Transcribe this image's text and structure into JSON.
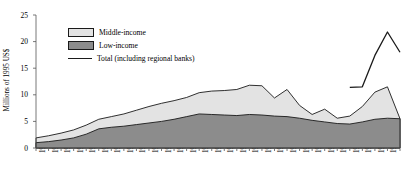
{
  "chart_data": {
    "type": "area",
    "stacked": true,
    "title": "",
    "subtitle": "",
    "xlabel": "",
    "ylabel": "Millions of 1995 US$",
    "ylim": [
      0,
      25
    ],
    "yticks": [
      0,
      5,
      10,
      15,
      20,
      25
    ],
    "ytick_labels": [
      "0",
      "5",
      "10",
      "15",
      "20",
      "25"
    ],
    "grid": false,
    "legend_position": "top-left",
    "categories": [
      "1970",
      "1971",
      "1972",
      "1973",
      "1974",
      "1975",
      "1976",
      "1977",
      "1978",
      "1979",
      "1980",
      "1981",
      "1982",
      "1983",
      "1984",
      "1985",
      "1986",
      "1987",
      "1988",
      "1989",
      "1990",
      "1991",
      "1992",
      "1993",
      "1994",
      "1995",
      "1996",
      "1997",
      "1998",
      "1999"
    ],
    "series": [
      {
        "name": "Low-income",
        "color": "#8c8c8c",
        "values": [
          1.0,
          1.2,
          1.5,
          1.9,
          2.6,
          3.6,
          3.9,
          4.1,
          4.4,
          4.7,
          5.0,
          5.4,
          5.9,
          6.4,
          6.3,
          6.2,
          6.1,
          6.3,
          6.2,
          6.0,
          5.9,
          5.6,
          5.2,
          4.9,
          4.6,
          4.5,
          4.9,
          5.4,
          5.6,
          5.5
        ]
      },
      {
        "name": "Middle-income",
        "color": "#e3e3e3",
        "values": [
          0.9,
          1.1,
          1.3,
          1.5,
          1.7,
          1.8,
          2.0,
          2.3,
          2.7,
          3.1,
          3.4,
          3.5,
          3.6,
          4.0,
          4.4,
          4.6,
          4.9,
          5.5,
          5.5,
          3.4,
          5.1,
          2.4,
          1.1,
          2.4,
          1.0,
          1.5,
          2.9,
          5.1,
          5.9,
          0.0
        ]
      }
    ],
    "total_line": {
      "name": "Total (including regional banks)",
      "color": "#1a1a1a",
      "x": [
        "1995",
        "1996",
        "1997",
        "1998",
        "1999"
      ],
      "values": [
        11.4,
        11.5,
        17.4,
        21.8,
        18.0
      ]
    },
    "legend": [
      {
        "label": "Middle-income",
        "marker": "filled-box",
        "color": "#e3e3e3"
      },
      {
        "label": "Low-income",
        "marker": "filled-box",
        "color": "#8c8c8c"
      },
      {
        "label": "Total (including regional banks)",
        "marker": "line",
        "color": "#1a1a1a"
      }
    ]
  }
}
